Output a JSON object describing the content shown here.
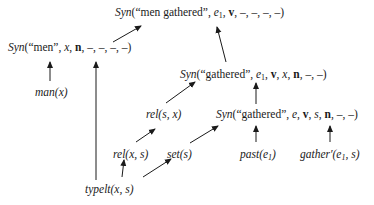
{
  "diagram": {
    "type": "derivation-tree",
    "nodes": {
      "root": {
        "fn": "Syn",
        "args_text": "(“men gathered”, ",
        "e": "e",
        "e_sub": "1",
        "rest_bold": "v",
        "tail": ", –, –, –, –)"
      },
      "men": {
        "fn": "Syn",
        "args_text": "(“men”, ",
        "var": "x",
        "sep": ", ",
        "bold": "n",
        "tail": ", –, –, –, –)"
      },
      "man": {
        "text": "man(x)"
      },
      "gathered_e1": {
        "fn": "Syn",
        "args_text": "(“gathered”, ",
        "e": "e",
        "e_sub": "1",
        "sep1": ", ",
        "bold1": "v",
        "mid": ", ",
        "var": "x",
        "sep2": ", ",
        "bold2": "n",
        "tail": ", –, –)"
      },
      "rel_sx": {
        "text": "rel(s, x)"
      },
      "gathered_e": {
        "fn": "Syn",
        "args_text": "(“gathered”, ",
        "e": "e",
        "sep1": ", ",
        "bold1": "v",
        "mid": ", ",
        "var": "s",
        "sep2": ", ",
        "bold2": "n",
        "tail": ", –, –)"
      },
      "rel_xs": {
        "text": "rel(x, s)"
      },
      "set_s": {
        "text": "set(s)"
      },
      "past": {
        "fn": "past(e",
        "sub": "1",
        "close": ")"
      },
      "gather": {
        "fn": "gather′(e",
        "sub": "1",
        "close": ", s)"
      },
      "typelt": {
        "text": "typelt(x, s)"
      }
    },
    "edges": [
      [
        "men",
        "root"
      ],
      [
        "gathered_e1",
        "root"
      ],
      [
        "man",
        "men"
      ],
      [
        "typelt",
        "men"
      ],
      [
        "rel_sx",
        "gathered_e1"
      ],
      [
        "gathered_e",
        "gathered_e1"
      ],
      [
        "rel_xs",
        "rel_sx"
      ],
      [
        "set_s",
        "gathered_e"
      ],
      [
        "past",
        "gathered_e"
      ],
      [
        "gather",
        "gathered_e"
      ],
      [
        "typelt",
        "rel_xs"
      ],
      [
        "typelt",
        "set_s"
      ]
    ]
  }
}
